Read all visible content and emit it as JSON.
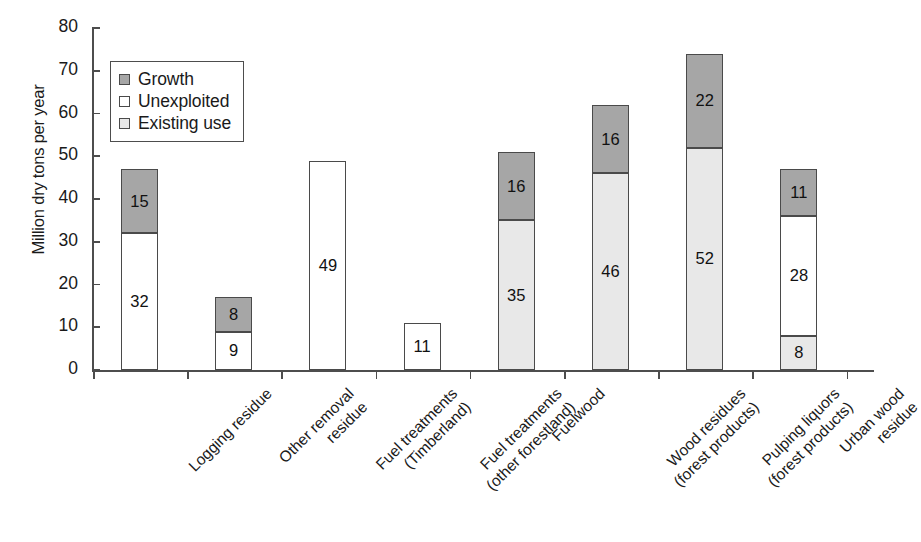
{
  "chart_data": {
    "type": "bar",
    "subtype": "stacked",
    "title": "",
    "xlabel": "",
    "ylabel": "Million dry tons per year",
    "ylim": [
      0,
      80
    ],
    "yticks": [
      0,
      10,
      20,
      30,
      40,
      50,
      60,
      70,
      80
    ],
    "grid": false,
    "legend_position": "upper-left-inside",
    "categories": [
      "Logging residue",
      "Other removal residue",
      "Fuel treatments (Timberland)",
      "Fuel treatments (other forestland)",
      "Fuelwood",
      "Wood residues (forest products)",
      "Pulping liquors (forest products)",
      "Urban wood residue"
    ],
    "category_lines": [
      [
        "Logging residue"
      ],
      [
        "Other removal",
        "residue"
      ],
      [
        "Fuel treatments",
        "(Timberland)"
      ],
      [
        "Fuel treatments",
        "(other forestland)"
      ],
      [
        "Fuelwood"
      ],
      [
        "Wood residues",
        "(forest products)"
      ],
      [
        "Pulping liquors",
        "(forest products)"
      ],
      [
        "Urban wood",
        "residue"
      ]
    ],
    "series": [
      {
        "name": "Existing use",
        "color": "#e8e8e8",
        "values": [
          0,
          0,
          0,
          0,
          35,
          46,
          52,
          8
        ]
      },
      {
        "name": "Unexploited",
        "color": "#ffffff",
        "values": [
          32,
          9,
          49,
          11,
          0,
          0,
          0,
          28
        ]
      },
      {
        "name": "Growth",
        "color": "#a6a6a6",
        "values": [
          15,
          8,
          0,
          0,
          16,
          16,
          22,
          11
        ]
      }
    ],
    "totals": [
      47,
      17,
      49,
      11,
      51,
      70,
      74,
      47
    ],
    "stack_order_bottom_to_top": [
      "Existing use",
      "Unexploited",
      "Growth"
    ]
  },
  "legend": {
    "entries": [
      {
        "label": "Growth",
        "swatch": "#a6a6a6"
      },
      {
        "label": "Unexploited",
        "swatch": "#ffffff"
      },
      {
        "label": "Existing use",
        "swatch": "#e8e8e8"
      }
    ]
  },
  "axis": {
    "y_title": "Million dry tons per year",
    "y_tick_labels": [
      "80",
      "70",
      "60",
      "50",
      "40",
      "30",
      "20",
      "10",
      "0"
    ]
  },
  "bar_labels": {
    "b0": [
      "15",
      "32"
    ],
    "b1": [
      "8",
      "9"
    ],
    "b2": [
      "49"
    ],
    "b3": [
      "11"
    ],
    "b4": [
      "16",
      "35"
    ],
    "b5": [
      "16",
      "8",
      "46"
    ],
    "b6": [
      "22",
      "52"
    ],
    "b7": [
      "11",
      "28",
      "8"
    ]
  }
}
